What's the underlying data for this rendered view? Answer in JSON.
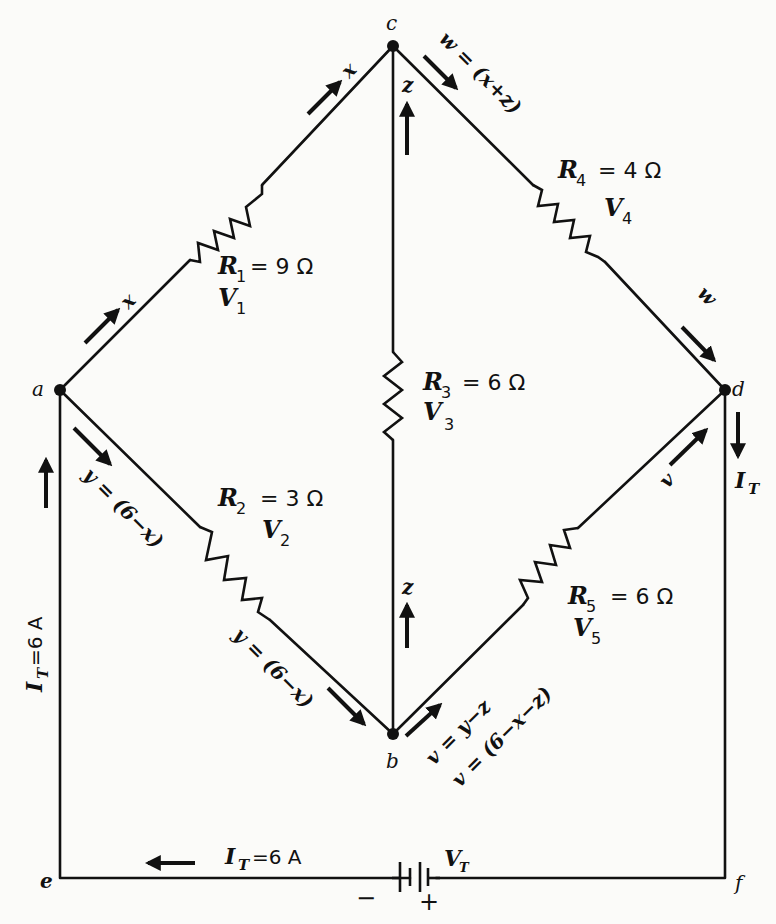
{
  "nodes": {
    "a": "a",
    "b": "b",
    "c": "c",
    "d": "d",
    "e": "e",
    "f": "f"
  },
  "resistors": [
    {
      "id": "R1",
      "sym": "R",
      "sub": "1",
      "eq": "= 9 Ω",
      "vsym": "V",
      "vsub": "1"
    },
    {
      "id": "R2",
      "sym": "R",
      "sub": "2",
      "eq": "= 3 Ω",
      "vsym": "V",
      "vsub": "2"
    },
    {
      "id": "R3",
      "sym": "R",
      "sub": "3",
      "eq": "= 6 Ω",
      "vsym": "V",
      "vsub": "3"
    },
    {
      "id": "R4",
      "sym": "R",
      "sub": "4",
      "eq": "= 4 Ω",
      "vsym": "V",
      "vsub": "4"
    },
    {
      "id": "R5",
      "sym": "R",
      "sub": "5",
      "eq": "= 6 Ω",
      "vsym": "V",
      "vsub": "5"
    }
  ],
  "currents": {
    "x_upper": "x",
    "x_lower": "x",
    "z_upper": "z",
    "z_lower": "z",
    "w_top": "w = (x+z)",
    "w_right": "w",
    "y_upper": "y = (6−x)",
    "y_lower": "y = (6−x)",
    "v_eq1": "v = y−z",
    "v_eq2": "v = (6−x−z)",
    "v_right": "v",
    "it_right_sym": "I",
    "it_right_sub": "T",
    "it_left_sym": "I",
    "it_left_sub": "T",
    "it_left_val": "=6 A",
    "it_bottom_sym": "I",
    "it_bottom_sub": "T",
    "it_bottom_val": "=6 A"
  },
  "battery": {
    "vsym": "V",
    "vsub": "T",
    "minus": "−",
    "plus": "+"
  }
}
